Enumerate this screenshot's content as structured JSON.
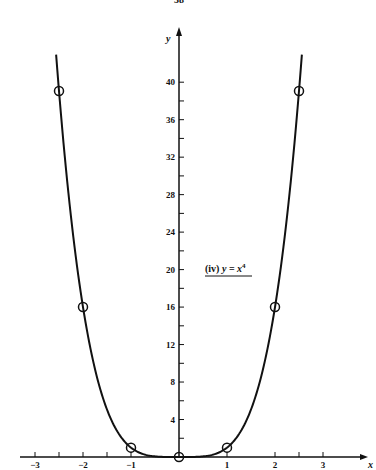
{
  "page": {
    "number": "38"
  },
  "chart_data": {
    "type": "line",
    "title": "",
    "annotation": "(iv) y = x⁴",
    "annotation_parts": {
      "prefix": "(iv) ",
      "lhs": "y",
      "eq": " = ",
      "base": "x",
      "exp": "4"
    },
    "xlabel": "x",
    "ylabel": "y",
    "xlim": [
      -3.3,
      3.7
    ],
    "ylim": [
      0,
      44
    ],
    "x_ticks": [
      -3,
      -2.5,
      -2,
      -1.5,
      -1,
      1,
      2,
      2.5,
      3
    ],
    "x_tick_labels": [
      {
        "x": -3,
        "label": "−3"
      },
      {
        "x": -2,
        "label": "−2"
      },
      {
        "x": -1,
        "label": "−1"
      },
      {
        "x": 1,
        "label": "1"
      },
      {
        "x": 2,
        "label": "2"
      },
      {
        "x": 3,
        "label": "3"
      }
    ],
    "y_ticks": [
      2,
      4,
      6,
      8,
      10,
      12,
      14,
      16,
      18,
      20,
      22,
      24,
      26,
      28,
      30,
      32,
      34,
      36,
      38,
      40
    ],
    "y_tick_labels": [
      {
        "y": 4,
        "label": "4"
      },
      {
        "y": 8,
        "label": "8"
      },
      {
        "y": 12,
        "label": "12"
      },
      {
        "y": 16,
        "label": "16"
      },
      {
        "y": 20,
        "label": "20"
      },
      {
        "y": 24,
        "label": "24"
      },
      {
        "y": 28,
        "label": "28"
      },
      {
        "y": 32,
        "label": "32"
      },
      {
        "y": 36,
        "label": "36"
      },
      {
        "y": 40,
        "label": "40"
      }
    ],
    "grid": false,
    "series": [
      {
        "name": "y = x^4",
        "function": "x^4",
        "x_range": [
          -2.56,
          2.56
        ],
        "marked_points": [
          {
            "x": -2.5,
            "y": 39.06
          },
          {
            "x": -2,
            "y": 16
          },
          {
            "x": -1,
            "y": 1
          },
          {
            "x": 0,
            "y": 0
          },
          {
            "x": 1,
            "y": 1
          },
          {
            "x": 2,
            "y": 16
          },
          {
            "x": 2.5,
            "y": 39.06
          }
        ]
      }
    ]
  }
}
